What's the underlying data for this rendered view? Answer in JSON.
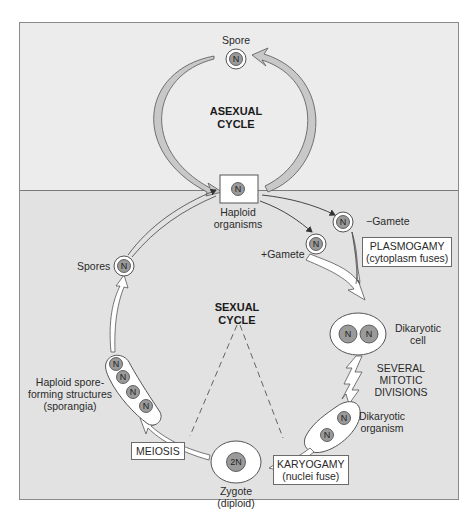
{
  "diagram": {
    "sections": {
      "asexual": {
        "title_line1": "ASEXUAL",
        "title_line2": "CYCLE"
      },
      "sexual": {
        "title_line1": "SEXUAL",
        "title_line2": "CYCLE"
      }
    },
    "labels": {
      "spore": "Spore",
      "haploid_organisms_line1": "Haploid",
      "haploid_organisms_line2": "organisms",
      "minus_gamete": "−Gamete",
      "plus_gamete": "+Gamete",
      "dikaryotic_cell_line1": "Dikaryotic",
      "dikaryotic_cell_line2": "cell",
      "mitotic_line1": "SEVERAL",
      "mitotic_line2": "MITOTIC",
      "mitotic_line3": "DIVISIONS",
      "dikaryotic_organism_line1": "Dikaryotic",
      "dikaryotic_organism_line2": "organism",
      "zygote_line1": "Zygote",
      "zygote_line2": "(diploid)",
      "spores": "Spores",
      "sporangia_line1": "Haploid spore-",
      "sporangia_line2": "forming structures",
      "sporangia_line3": "(sporangia)"
    },
    "boxes": {
      "plasmogamy_line1": "PLASMOGAMY",
      "plasmogamy_line2": "(cytoplasm fuses)",
      "karyogamy_line1": "KARYOGAMY",
      "karyogamy_line2": "(nuclei fuse)",
      "meiosis": "MEIOSIS"
    },
    "nuclei": {
      "haploid": "N",
      "diploid": "2N"
    },
    "colors": {
      "upper_bg": "#ececec",
      "lower_bg": "#e2e2e2",
      "arrow_fill": "#c4c4c4",
      "nucleus_fill": "#9a9a9a",
      "cell_fill": "#ffffff"
    }
  }
}
